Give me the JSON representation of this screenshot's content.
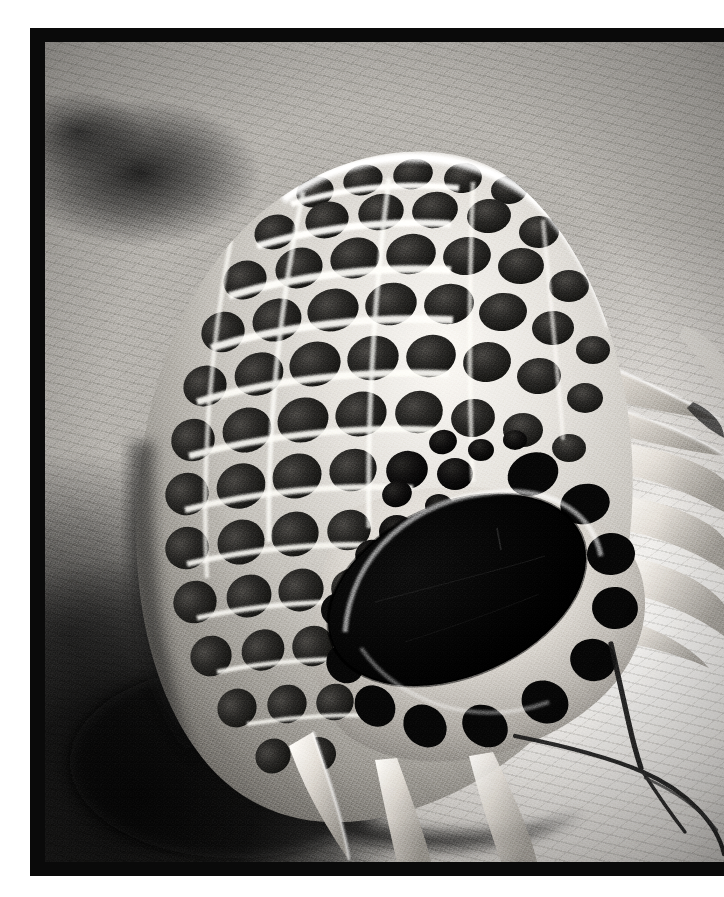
{
  "plate": {
    "kind": "scanning-electron-micrograph",
    "orientation": "portrait",
    "width_px": 724,
    "height_px": 897,
    "page_background": "#ffffff",
    "margins": {
      "left_px": 30,
      "top_px": 28,
      "right_px": 0,
      "bottom_px": 21
    }
  },
  "frame": {
    "name": "black-photo-border",
    "color": "#0a0a0a",
    "thickness_px": 14,
    "left_px": 30,
    "top_px": 28,
    "width_px": 694,
    "height_px": 848,
    "bleeds_right_edge": true
  },
  "photo": {
    "left_px": 45,
    "top_px": 42,
    "width_px": 679,
    "height_px": 820,
    "palette": {
      "deepest_black": "#0a0a0a",
      "pore_shadow": "#1e1e1e",
      "mid_gray": "#8d8c89",
      "substrate_light": "#e9e7e3",
      "ridge_highlight": "#fbfbf8",
      "specimen_wall": "#c9c6c1"
    },
    "tone": "monochrome greyscale, high contrast, film-grain halftone"
  },
  "subject": {
    "label": "microfossil-test",
    "description": "Domed lattice shell with hexagonal pore grid, large elliptical aperture and radiating spines",
    "aperture": {
      "name": "elliptical-aperture",
      "center_pct": {
        "x": 60,
        "y": 63
      },
      "width_pct": 40,
      "height_pct": 26,
      "rotation_deg": -24,
      "fill": "#080808"
    },
    "lattice": {
      "pattern": "hexagonal honeycomb",
      "pore_rows": 12,
      "pores_per_row_max": 13,
      "pore_fill": "#242424",
      "ridge_color": "#f6f5f1"
    },
    "spines": [
      {
        "name": "spine-upper-right",
        "tip_pct": {
          "x": 97,
          "y": 44
        },
        "length_pct": 28
      },
      {
        "name": "spine-right-upper",
        "tip_pct": {
          "x": 99,
          "y": 52
        },
        "length_pct": 18
      },
      {
        "name": "spine-lower-left",
        "tip_pct": {
          "x": 43,
          "y": 97
        },
        "length_pct": 22
      },
      {
        "name": "spine-bottom",
        "tip_pct": {
          "x": 58,
          "y": 99
        },
        "length_pct": 14
      }
    ]
  },
  "substrate": {
    "name": "mounting-stub-surface",
    "shading": "bright at lower-right, dark shadow pooled at lower-left",
    "cracks": [
      {
        "name": "crack-vertical-right",
        "from_pct": {
          "x": 84,
          "y": 74
        },
        "to_pct": {
          "x": 88,
          "y": 86
        }
      },
      {
        "name": "crack-diagonal-right",
        "from_pct": {
          "x": 70,
          "y": 85
        },
        "to_pct": {
          "x": 99,
          "y": 99
        }
      },
      {
        "name": "crack-branch",
        "from_pct": {
          "x": 86,
          "y": 82
        },
        "to_pct": {
          "x": 95,
          "y": 92
        }
      }
    ]
  },
  "annotations": {
    "scale_bar": null,
    "caption": null,
    "magnification_text": null,
    "any_visible_text": false
  }
}
